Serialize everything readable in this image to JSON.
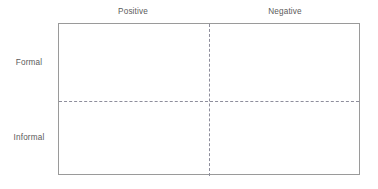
{
  "diagram": {
    "type": "2x2-quadrant-matrix",
    "columns": [
      {
        "label": "Positive"
      },
      {
        "label": "Negative"
      }
    ],
    "rows": [
      {
        "label": "Formal"
      },
      {
        "label": "Informal"
      }
    ],
    "quadrants": [
      {
        "row": "Formal",
        "column": "Positive",
        "content": ""
      },
      {
        "row": "Formal",
        "column": "Negative",
        "content": ""
      },
      {
        "row": "Informal",
        "column": "Positive",
        "content": ""
      },
      {
        "row": "Informal",
        "column": "Negative",
        "content": ""
      }
    ],
    "colors": {
      "border": "#9a9a9a",
      "divider": "#8e8e9c",
      "label_text": "#5b5b5b",
      "background": "#ffffff"
    }
  }
}
